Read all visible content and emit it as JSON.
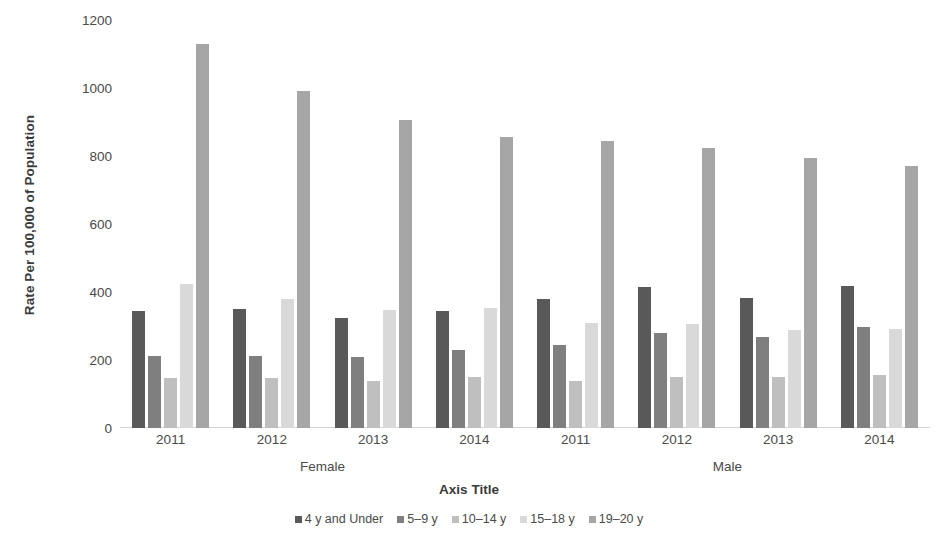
{
  "chart_data": {
    "type": "bar",
    "title": "",
    "subtitle": "",
    "xlabel": "Axis Title",
    "ylabel": "Rate Per 100,000 of Population",
    "ylim": [
      0,
      1200
    ],
    "ytick_values": [
      0,
      200,
      400,
      600,
      800,
      1000,
      1200
    ],
    "ytick_labels": [
      "0",
      "200",
      "400",
      "600",
      "800",
      "1000",
      "1200"
    ],
    "grid": false,
    "legend_position": "bottom",
    "categories": [
      "2011",
      "2012",
      "2013",
      "2014",
      "2011",
      "2012",
      "2013",
      "2014"
    ],
    "group_labels": [
      "Female",
      "Male"
    ],
    "group_spans": [
      4,
      4
    ],
    "series": [
      {
        "name": "4 y and Under",
        "color": "#595959",
        "values": [
          345,
          350,
          325,
          345,
          380,
          415,
          382,
          418
        ]
      },
      {
        "name": "5–9 y",
        "color": "#7f7f7f",
        "values": [
          213,
          212,
          210,
          229,
          245,
          279,
          269,
          296
        ]
      },
      {
        "name": "10–14 y",
        "color": "#bfbfbf",
        "values": [
          148,
          146,
          139,
          149,
          139,
          150,
          151,
          155
        ]
      },
      {
        "name": "15–18 y",
        "color": "#d9d9d9",
        "values": [
          425,
          378,
          346,
          352,
          310,
          305,
          288,
          291
        ]
      },
      {
        "name": "19–20 y",
        "color": "#a6a6a6",
        "values": [
          1128,
          990,
          905,
          855,
          843,
          824,
          794,
          772
        ]
      }
    ]
  },
  "legend": {
    "items": [
      {
        "label": "4 y and Under",
        "color": "#595959"
      },
      {
        "label": "5–9 y",
        "color": "#7f7f7f"
      },
      {
        "label": "10–14 y",
        "color": "#bfbfbf"
      },
      {
        "label": "15–18 y",
        "color": "#d9d9d9"
      },
      {
        "label": "19–20 y",
        "color": "#a6a6a6"
      }
    ]
  },
  "axis": {
    "y_title": "Rate Per 100,000 of Population",
    "x_title": "Axis Title"
  }
}
